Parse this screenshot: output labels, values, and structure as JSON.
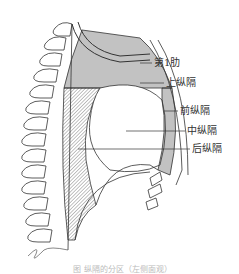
{
  "figure": {
    "labels": {
      "rib1": "第1肋",
      "superior": "上纵隔",
      "anterior": "前纵隔",
      "middle": "中纵隔",
      "posterior": "后纵隔"
    },
    "caption": "图  纵隔的分区（左侧面观）",
    "colors": {
      "line": "#333333",
      "background": "#ffffff"
    }
  }
}
